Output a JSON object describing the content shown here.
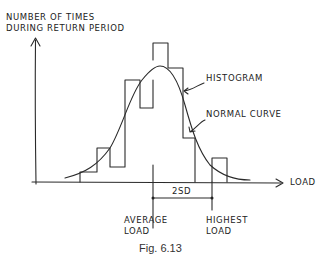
{
  "figure": {
    "caption": "Fig. 6.13",
    "y_axis_label_line1": "NUMBER OF TIMES",
    "y_axis_label_line2": "DURING RETURN PERIOD",
    "x_axis_label": "LOAD",
    "annotations": {
      "histogram": "HISTOGRAM",
      "normal_curve": "NORMAL CURVE",
      "two_sd": "2SD",
      "average_line1": "AVERAGE",
      "average_line2": "LOAD",
      "highest_line1": "HIGHEST",
      "highest_line2": "LOAD"
    }
  },
  "diagram": {
    "type": "histogram with fitted normal curve",
    "elements": [
      "y-axis (number of times)",
      "x-axis (load)",
      "histogram bars",
      "normal curve",
      "average load marker",
      "highest load marker",
      "2SD dimension"
    ]
  }
}
